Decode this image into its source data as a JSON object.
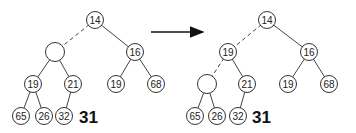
{
  "before": {
    "nodes": [
      {
        "id": "n14",
        "label": "14",
        "x": 95,
        "y": 20
      },
      {
        "id": "hole",
        "label": "",
        "x": 55,
        "y": 52
      },
      {
        "id": "n16",
        "label": "16",
        "x": 135,
        "y": 52
      },
      {
        "id": "n19a",
        "label": "19",
        "x": 33,
        "y": 84
      },
      {
        "id": "n21",
        "label": "21",
        "x": 73,
        "y": 84
      },
      {
        "id": "n19b",
        "label": "19",
        "x": 116,
        "y": 84
      },
      {
        "id": "n68",
        "label": "68",
        "x": 156,
        "y": 84
      },
      {
        "id": "n65",
        "label": "65",
        "x": 21,
        "y": 116
      },
      {
        "id": "n26",
        "label": "26",
        "x": 44,
        "y": 116
      },
      {
        "id": "n32",
        "label": "32",
        "x": 64,
        "y": 116
      }
    ],
    "pending_value": "31"
  },
  "after": {
    "nodes": [
      {
        "id": "n14",
        "label": "14",
        "x": 267,
        "y": 20
      },
      {
        "id": "n19a",
        "label": "19",
        "x": 228,
        "y": 52
      },
      {
        "id": "n16",
        "label": "16",
        "x": 309,
        "y": 52
      },
      {
        "id": "hole",
        "label": "",
        "x": 207,
        "y": 84
      },
      {
        "id": "n21",
        "label": "21",
        "x": 247,
        "y": 84
      },
      {
        "id": "n19b",
        "label": "19",
        "x": 288,
        "y": 84
      },
      {
        "id": "n68",
        "label": "68",
        "x": 329,
        "y": 84
      },
      {
        "id": "n65",
        "label": "65",
        "x": 195,
        "y": 116
      },
      {
        "id": "n26",
        "label": "26",
        "x": 217,
        "y": 116
      },
      {
        "id": "n32",
        "label": "32",
        "x": 238,
        "y": 116
      }
    ],
    "pending_value": "31"
  },
  "arrow": {
    "label": "transition"
  }
}
